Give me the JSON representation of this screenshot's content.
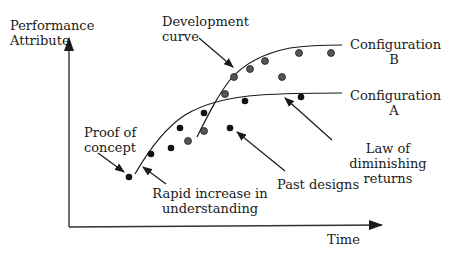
{
  "diagram": {
    "y_axis_label": [
      "Performance",
      "Attribute"
    ],
    "x_axis_label": "Time",
    "labels": {
      "development_curve": [
        "Development",
        "curve"
      ],
      "config_b": [
        "Configuration",
        "B"
      ],
      "config_a": [
        "Configuration",
        "A"
      ],
      "proof_of_concept": [
        "Proof of",
        "concept"
      ],
      "rapid_increase": [
        "Rapid increase in",
        "understanding"
      ],
      "past_designs": "Past designs",
      "law_of_diminishing": [
        "Law of",
        "diminishing",
        "returns"
      ]
    },
    "colors": {
      "ink": "#1a1a1a",
      "grey_point": "#555555",
      "background": "#ffffff"
    }
  }
}
